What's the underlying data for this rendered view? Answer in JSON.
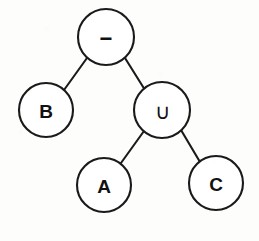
{
  "diagram": {
    "kind": "binary-expression-tree",
    "background_color": "#fdfdfc",
    "stroke_color": "#1a1a1a",
    "node_fill_color": "#ffffff",
    "nodes": [
      {
        "id": "root",
        "label": "−",
        "semantic": "minus-operator",
        "cx": 106,
        "cy": 37,
        "r": 28
      },
      {
        "id": "left",
        "label": "B",
        "semantic": "operand-b",
        "cx": 46,
        "cy": 110,
        "r": 27
      },
      {
        "id": "union",
        "label": "∪",
        "semantic": "union-operator",
        "cx": 162,
        "cy": 110,
        "r": 28
      },
      {
        "id": "a",
        "label": "A",
        "semantic": "operand-a",
        "cx": 104,
        "cy": 185,
        "r": 27
      },
      {
        "id": "c",
        "label": "C",
        "semantic": "operand-c",
        "cx": 216,
        "cy": 183,
        "r": 27
      }
    ],
    "edges": [
      {
        "id": "edge-root-b",
        "from": "root",
        "to": "left",
        "x1": 87,
        "y1": 58,
        "x2": 64,
        "y2": 90
      },
      {
        "id": "edge-root-union",
        "from": "root",
        "to": "union",
        "x1": 125,
        "y1": 58,
        "x2": 145,
        "y2": 90
      },
      {
        "id": "edge-union-a",
        "from": "union",
        "to": "a",
        "x1": 144,
        "y1": 131,
        "x2": 121,
        "y2": 163
      },
      {
        "id": "edge-union-c",
        "from": "union",
        "to": "c",
        "x1": 181,
        "y1": 130,
        "x2": 200,
        "y2": 162
      }
    ]
  }
}
